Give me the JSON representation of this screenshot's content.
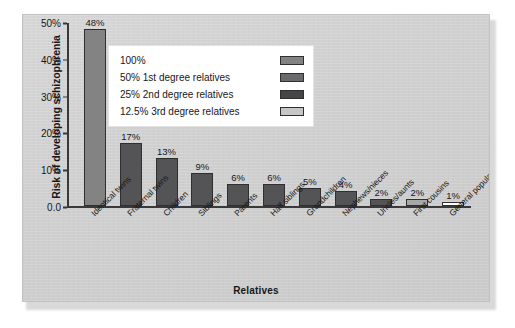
{
  "chart_data": {
    "type": "bar",
    "title": "",
    "xlabel": "Relatives",
    "ylabel": "Risk of developing schizophrenia",
    "ylim": [
      0,
      50
    ],
    "grid": false,
    "y_ticks": [
      {
        "value": 0,
        "label": "0.0"
      },
      {
        "value": 10,
        "label": "10%"
      },
      {
        "value": 20,
        "label": "20%"
      },
      {
        "value": 30,
        "label": "30%"
      },
      {
        "value": 40,
        "label": "40%"
      },
      {
        "value": 50,
        "label": "50%"
      }
    ],
    "categories": [
      "Identical twins",
      "Fraternal twins",
      "Children",
      "Siblings",
      "Parents",
      "Half siblings",
      "Grandchildren",
      "Nephews/nieces",
      "Uncles/aunts",
      "First cousins",
      "General population"
    ],
    "values": [
      48,
      17,
      13,
      9,
      6,
      6,
      5,
      4,
      2,
      2,
      1
    ],
    "value_labels": [
      "48%",
      "17%",
      "13%",
      "9%",
      "6%",
      "6%",
      "5%",
      "4%",
      "2%",
      "2%",
      "1%"
    ],
    "bar_colors": [
      "#838383",
      "#545457",
      "#545457",
      "#545457",
      "#545457",
      "#545457",
      "#545457",
      "#545457",
      "#545457",
      "#a8a8a8",
      "#ffffff"
    ],
    "legend": {
      "position": "upper-center",
      "entries": [
        {
          "label": "100%",
          "color": "#838383"
        },
        {
          "label": "50% 1st degree relatives",
          "color": "#6a6a6d"
        },
        {
          "label": "25% 2nd degree relatives",
          "color": "#454548"
        },
        {
          "label": "12.5% 3rd degree relatives",
          "color": "#c6c6c6"
        }
      ]
    }
  }
}
